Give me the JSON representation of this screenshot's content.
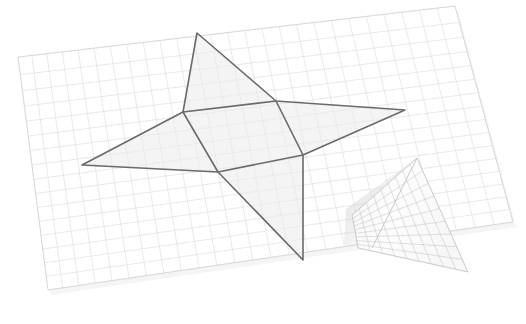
{
  "scene": {
    "title": "3D folded grid plane with four-pointed star polygon",
    "background_color": "#ffffff",
    "canvas": {
      "width": 526,
      "height": 324
    },
    "description": "Perspective view of a graph-paper sheet lying in 3D space with a triangular flap folded upward at the lower right, and a four-pointed star (pinwheel) polygon outlined on the sheet surface."
  },
  "colors": {
    "paper_fill": "#ffffff",
    "paper_edge": "#d8d8d8",
    "grid_minor": "#d9d9dd",
    "grid_major": "#c4c4c9",
    "star_outline": "#6a6a6a",
    "star_fill": "#eeeeee",
    "star_fill_opacity": "0.55",
    "flap_fill": "#fbfbfb",
    "flap_grid": "#b9b9bf",
    "shadow": "#e6e6e6",
    "background": "#ffffff"
  },
  "grid_plane": {
    "name": "graph-paper-plane",
    "corners": [
      {
        "label": "top-left",
        "x": 18,
        "y": 57
      },
      {
        "label": "top-right",
        "x": 455,
        "y": 6
      },
      {
        "label": "bottom-right",
        "x": 513,
        "y": 222
      },
      {
        "label": "bottom-left",
        "x": 48,
        "y": 290
      }
    ],
    "columns": 26,
    "rows": 16,
    "major_every": 0,
    "line_width": 0.6
  },
  "folded_flap": {
    "name": "folded-triangular-flap",
    "apex": {
      "x": 417,
      "y": 158
    },
    "base_left": {
      "x": 358,
      "y": 248
    },
    "base_right": {
      "x": 468,
      "y": 272
    },
    "fold_hinge_left": {
      "x": 352,
      "y": 215
    },
    "fold_hinge_right": {
      "x": 468,
      "y": 272
    },
    "columns": 9,
    "rows": 9,
    "line_width": 0.55
  },
  "star_polygon": {
    "name": "four-pointed-star",
    "point_count": 4,
    "outer_points": [
      {
        "label": "top",
        "x": 197,
        "y": 33
      },
      {
        "label": "right",
        "x": 405,
        "y": 110
      },
      {
        "label": "bottom",
        "x": 303,
        "y": 260
      },
      {
        "label": "left",
        "x": 82,
        "y": 165
      }
    ],
    "inner_vertices": [
      {
        "label": "inner-top-left",
        "x": 183,
        "y": 112
      },
      {
        "label": "inner-top-right",
        "x": 276,
        "y": 101
      },
      {
        "label": "inner-bottom-right",
        "x": 303,
        "y": 155
      },
      {
        "label": "inner-bottom-left",
        "x": 218,
        "y": 172
      }
    ],
    "outline_width": 1.6
  }
}
